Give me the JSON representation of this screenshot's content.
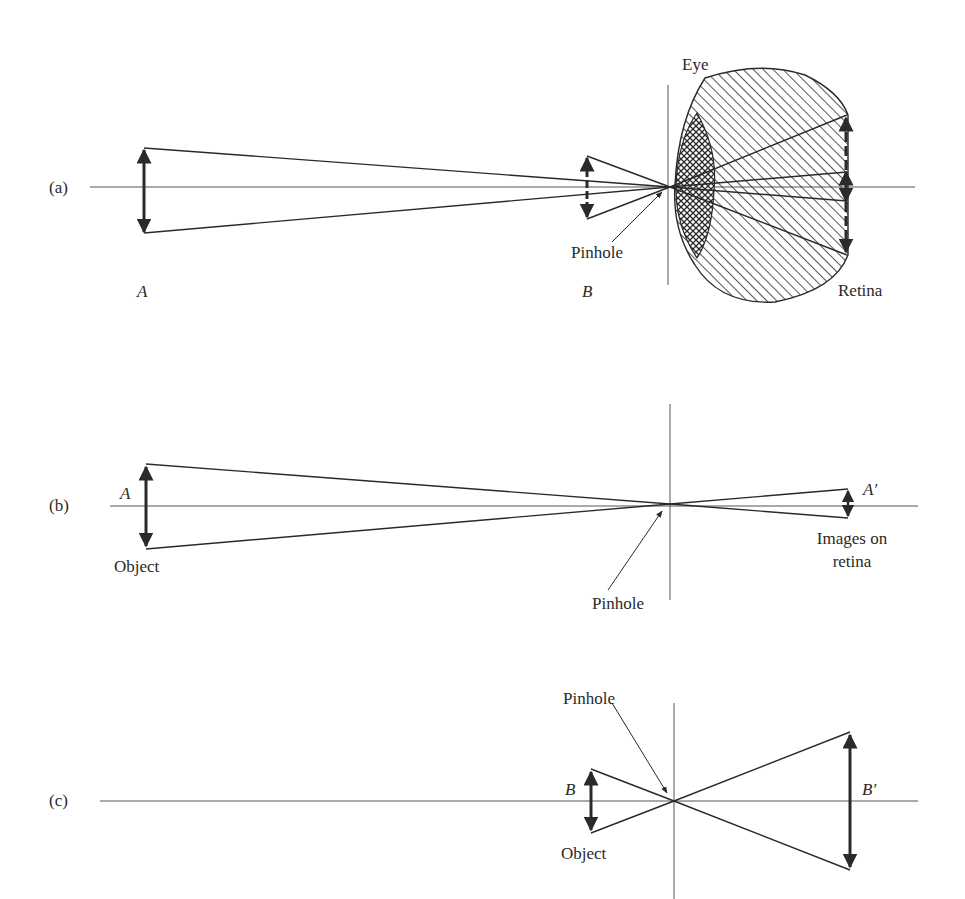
{
  "panels": {
    "a": {
      "tag": "(a)",
      "label_A": "A",
      "label_B": "B",
      "eye": "Eye",
      "pinhole": "Pinhole",
      "retina": "Retina"
    },
    "b": {
      "tag": "(b)",
      "label_A": "A",
      "label_A_prime": "A′",
      "object": "Object",
      "pinhole": "Pinhole",
      "images_line1": "Images on",
      "images_line2": "retina"
    },
    "c": {
      "tag": "(c)",
      "label_B": "B",
      "label_B_prime": "B′",
      "object": "Object",
      "pinhole": "Pinhole"
    }
  },
  "colors": {
    "ink": "#2a2a2a",
    "axis": "#555555",
    "background": "#ffffff"
  }
}
